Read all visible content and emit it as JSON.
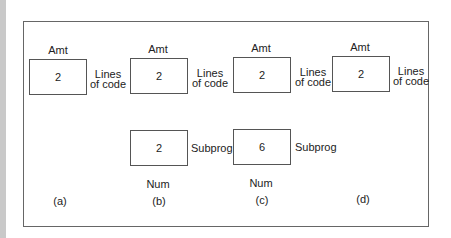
{
  "diagram": {
    "panels": [
      {
        "caption": "(a)",
        "top_box": {
          "label": "Amt",
          "value": "2",
          "side_label_line1": "Lines",
          "side_label_line2": "of code"
        }
      },
      {
        "caption": "(b)",
        "top_box": {
          "label": "Amt",
          "value": "2",
          "side_label_line1": "Lines",
          "side_label_line2": "of code"
        },
        "bottom_box": {
          "value": "2",
          "side_label": "Subprog",
          "label": "Num"
        }
      },
      {
        "caption": "(c)",
        "top_box": {
          "label": "Amt",
          "value": "2",
          "side_label_line1": "Lines",
          "side_label_line2": "of code"
        },
        "bottom_box": {
          "value": "6",
          "side_label": "Subprog",
          "label": "Num"
        }
      },
      {
        "caption": "(d)",
        "top_box": {
          "label": "Amt",
          "value": "2",
          "side_label_line1": "Lines",
          "side_label_line2": "of code"
        }
      }
    ]
  }
}
